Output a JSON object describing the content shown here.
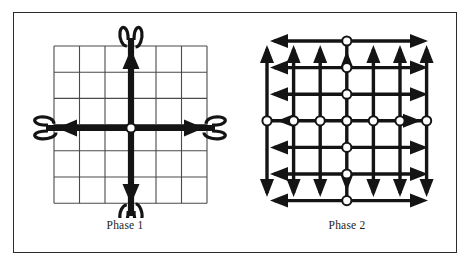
{
  "figure": {
    "border_color": "#2b2b2b",
    "background": "#ffffff",
    "ink_color": "#141414",
    "grid_color": "#4a4a4a",
    "node_fill": "#ffffff"
  },
  "panels": [
    {
      "id": "phase-1",
      "caption": "Phase 1",
      "grid": {
        "columns": 6,
        "rows": 6,
        "x0": 40,
        "y0": 33,
        "cell_width": 25.5,
        "cell_height": 26.2
      },
      "center_node": {
        "cx": 117,
        "cy": 115,
        "r": 4.6
      },
      "description": "Single vertical and single horizontal broadcast line crossing at the center node, each terminating in a U-turn loop with an arrowhead pointing back inward.",
      "axes": [
        {
          "name": "vertical-broadcast",
          "orientation": "vertical",
          "loops": 2,
          "arrowheads": 2
        },
        {
          "name": "horizontal-broadcast",
          "orientation": "horizontal",
          "loops": 2,
          "arrowheads": 2
        }
      ]
    },
    {
      "id": "phase-2",
      "caption": "Phase 2",
      "grid": {
        "columns": 6,
        "rows": 6,
        "x0": 31,
        "y0": 28,
        "cell_width": 26.6,
        "cell_height": 26.6
      },
      "center_row_nodes": 7,
      "center_column_nodes": 7,
      "node_radius": 4.6,
      "description": "Every grid row and every grid column carries an arrow; nodes sit along the middle row and middle column. Horizontal rows alternate arrow direction by half, vertical columns point up above the middle and down below it.",
      "row_arrow_directions": [
        "left",
        "left",
        "left",
        "both",
        "left",
        "left",
        "left"
      ],
      "column_arrow_directions": [
        "up",
        "up",
        "up",
        "both",
        "down",
        "down",
        "down"
      ]
    }
  ]
}
